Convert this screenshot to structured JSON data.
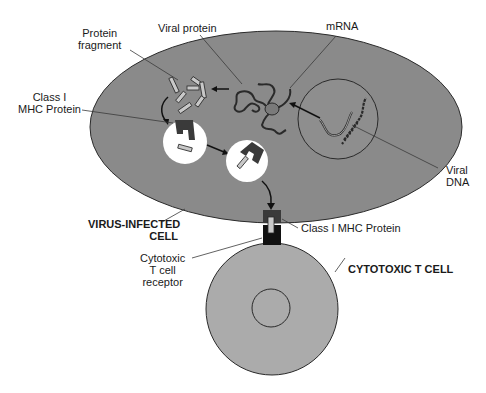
{
  "diagram": {
    "colors": {
      "infected_cell_fill": "#8a8a8a",
      "tcell_fill": "#ababab",
      "vesicle_fill": "#ffffff",
      "mhc_fill": "#3a3a3a",
      "fragment_fill": "#c8c8c8",
      "receptor_fill": "#111111",
      "outline": "#2a2a2a"
    },
    "labels": {
      "protein_fragment": [
        "Protein",
        "fragment"
      ],
      "viral_protein": "Viral protein",
      "mrna": "mRNA",
      "class1_mhc_top": [
        "Class I",
        "MHC Protein"
      ],
      "viral_dna": [
        "Viral",
        "DNA"
      ],
      "virus_infected_cell": [
        "VIRUS-INFECTED",
        "CELL"
      ],
      "class1_mhc_bottom": "Class I MHC Protein",
      "tcell_receptor": [
        "Cytotoxic",
        "T cell",
        "receptor"
      ],
      "cytotoxic_t_cell": "CYTOTOXIC T CELL"
    }
  }
}
